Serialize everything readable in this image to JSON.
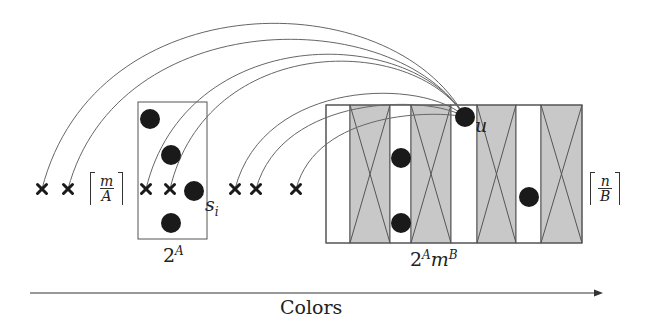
{
  "diagram": {
    "colors": {
      "stroke": "#555555",
      "curve": "#666666",
      "dot": "#1a1a1a",
      "gray_column": "#c8c8c8",
      "white_column": "#ffffff"
    },
    "left_block": {
      "label_base": "2",
      "label_exp": "A",
      "ceil_num": "m",
      "ceil_den": "A",
      "dot_label": "s",
      "dot_label_sub": "i",
      "box": {
        "x": 138,
        "y": 102,
        "w": 69,
        "h": 137
      },
      "dots": [
        {
          "cx": 150,
          "cy": 119
        },
        {
          "cx": 171,
          "cy": 155
        },
        {
          "cx": 194,
          "cy": 191
        },
        {
          "cx": 171,
          "cy": 223
        }
      ]
    },
    "right_block": {
      "label_base": "2",
      "label_exp1": "A",
      "label_mid": "m",
      "label_exp2": "B",
      "ceil_num": "n",
      "ceil_den": "B",
      "u_label": "u",
      "box": {
        "x": 326,
        "y": 105,
        "w": 256,
        "h": 138
      },
      "columns": [
        {
          "x": 326,
          "w": 24,
          "type": "white"
        },
        {
          "x": 350,
          "w": 40,
          "type": "gray"
        },
        {
          "x": 390,
          "w": 21,
          "type": "white"
        },
        {
          "x": 411,
          "w": 40,
          "type": "gray"
        },
        {
          "x": 451,
          "w": 26,
          "type": "white"
        },
        {
          "x": 477,
          "w": 39,
          "type": "gray"
        },
        {
          "x": 516,
          "w": 25,
          "type": "white"
        },
        {
          "x": 541,
          "w": 41,
          "type": "gray"
        }
      ],
      "dots": [
        {
          "cx": 465,
          "cy": 117,
          "name": "u"
        },
        {
          "cx": 401,
          "cy": 158
        },
        {
          "cx": 401,
          "cy": 223
        },
        {
          "cx": 529,
          "cy": 197
        }
      ]
    },
    "x_marks": [
      {
        "x": 42,
        "y": 189
      },
      {
        "x": 68,
        "y": 189
      },
      {
        "x": 146,
        "y": 189
      },
      {
        "x": 170,
        "y": 189
      },
      {
        "x": 235,
        "y": 189
      },
      {
        "x": 256,
        "y": 189
      },
      {
        "x": 296,
        "y": 189
      }
    ],
    "curves": [
      {
        "from": [
          465,
          117
        ],
        "to": [
          42,
          189
        ],
        "peak": 17
      },
      {
        "from": [
          465,
          117
        ],
        "to": [
          68,
          189
        ],
        "peak": 33
      },
      {
        "from": [
          465,
          117
        ],
        "to": [
          146,
          189
        ],
        "peak": 48
      },
      {
        "from": [
          465,
          117
        ],
        "to": [
          170,
          189
        ],
        "peak": 55
      },
      {
        "from": [
          465,
          117
        ],
        "to": [
          235,
          189
        ],
        "peak": 88
      },
      {
        "from": [
          465,
          117
        ],
        "to": [
          256,
          189
        ],
        "peak": 100
      },
      {
        "from": [
          465,
          117
        ],
        "to": [
          296,
          189
        ],
        "peak": 112
      }
    ],
    "axis": {
      "label": "Colors",
      "x1": 30,
      "x2": 603,
      "y": 293
    }
  }
}
